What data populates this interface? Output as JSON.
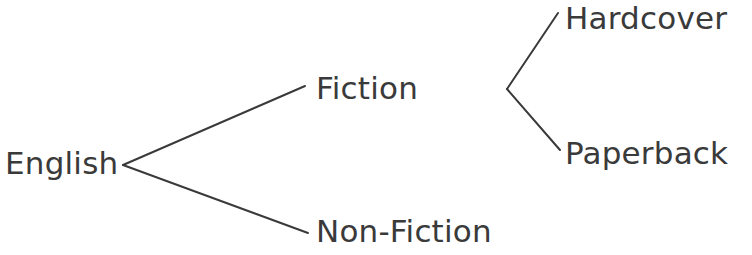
{
  "diagram": {
    "type": "tree",
    "background_color": "#ffffff",
    "line_color": "#3a3a3a",
    "text_color": "#3a3a3a",
    "line_width": 2,
    "nodes": {
      "english": {
        "label": "English",
        "x": 5,
        "y": 175,
        "level": 0
      },
      "fiction": {
        "label": "Fiction",
        "x": 316,
        "y": 100,
        "level": 1
      },
      "nonfiction": {
        "label": "Non-Fiction",
        "x": 316,
        "y": 243,
        "level": 1
      },
      "hardcover": {
        "label": "Hardcover",
        "x": 565,
        "y": 30,
        "level": 2
      },
      "paperback": {
        "label": "Paperback",
        "x": 565,
        "y": 165,
        "level": 2
      }
    },
    "edges": [
      {
        "from": "english",
        "to": "fiction",
        "points": "123,165 305,86"
      },
      {
        "from": "english",
        "to": "nonfiction",
        "points": "123,165 308,233"
      },
      {
        "from": "fiction",
        "to": "hardcover",
        "points": "507,89 558,13"
      },
      {
        "from": "fiction",
        "to": "paperback",
        "points": "507,89 560,150"
      }
    ]
  }
}
